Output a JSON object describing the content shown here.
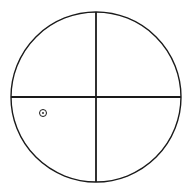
{
  "diagram": {
    "type": "quadrant-circle",
    "canvas": {
      "width": 190,
      "height": 191
    },
    "circle": {
      "cx": 96,
      "cy": 97,
      "r": 85,
      "stroke": "#1a1a1a",
      "stroke_width": 1.4
    },
    "vertical_axis": {
      "x": 96,
      "y1": 12,
      "y2": 182,
      "stroke": "#1a1a1a",
      "stroke_width": 1.8
    },
    "horizontal_axis": {
      "y": 97,
      "x1": 11,
      "x2": 181,
      "stroke": "#1a1a1a",
      "stroke_width": 1.8
    },
    "marker": {
      "cx": 43,
      "cy": 113,
      "outer_r": 3.5,
      "inner_r": 0.9,
      "quadrant": "lower-left",
      "stroke": "#1a1a1a"
    }
  }
}
